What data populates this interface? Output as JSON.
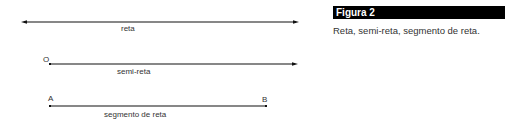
{
  "figure": {
    "title": "Figura 2",
    "caption": "Reta, semi-reta, segmento de reta."
  },
  "diagram": {
    "line_color": "#111111",
    "reta": {
      "label": "reta",
      "type": "line",
      "arrows": "both"
    },
    "semi_reta": {
      "label": "semi-reta",
      "type": "ray",
      "origin_label": "O",
      "arrows": "end"
    },
    "segmento": {
      "label": "segmento de reta",
      "type": "segment",
      "start_label": "A",
      "end_label": "B"
    }
  }
}
